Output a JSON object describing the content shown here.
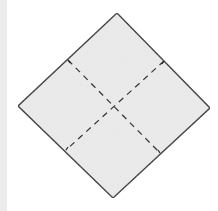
{
  "diagram": {
    "colors": {
      "paper_fill": "#ededed",
      "outline": "#222222",
      "fold_line": "#333333",
      "left_bar": "#ececec",
      "background": "#ffffff"
    },
    "square": {
      "top": [
        117,
        13
      ],
      "right": [
        210,
        108
      ],
      "bottom": [
        113,
        198
      ],
      "left": [
        18,
        106
      ]
    },
    "fold_lines": [
      {
        "name": "valley-fold-diagonal-a",
        "from": [
          68,
          60
        ],
        "to": [
          160,
          153
        ],
        "style": "dashed"
      },
      {
        "name": "valley-fold-diagonal-b",
        "from": [
          164,
          61
        ],
        "to": [
          66,
          150
        ],
        "style": "dashed"
      }
    ]
  }
}
